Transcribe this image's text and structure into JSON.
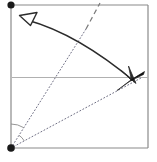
{
  "canvas": {
    "width": 157,
    "height": 162,
    "background": "#ffffff",
    "title": "Square fold diagram with rotation arrow"
  },
  "palette": {
    "frame_stroke": "#8a8a8a",
    "guide_stroke": "#b0b0b0",
    "dotted_stroke": "#6f6f84",
    "dashed_stroke": "#7a7a7a",
    "arrow_stroke": "#2b2b2b",
    "blade_fill": "#111111",
    "vertex_fill": "#1a1a1a"
  },
  "figure": {
    "square": {
      "label": "paper-square-frame",
      "left": 11,
      "top": 5,
      "right": 148,
      "bottom": 148,
      "stroke_width": 1.2
    },
    "vertices": [
      {
        "name": "top-left-vertex",
        "label": "A",
        "x": 11,
        "y": 5,
        "radius": 3.6
      },
      {
        "name": "bottom-left-vertex",
        "label": "B",
        "x": 11,
        "y": 148,
        "radius": 3.8
      }
    ],
    "horizontal_guide": {
      "label": "horizontal-center-guide",
      "x1": 12,
      "y1": 77.5,
      "x2": 148,
      "y2": 77.5,
      "stroke_width": 1.1
    },
    "dotted_rays": [
      {
        "name": "dotted-ray-upper",
        "description": "steep dotted crease from bottom-left vertex toward upper area",
        "x1": 11,
        "y1": 148,
        "x2": 86,
        "y2": 29,
        "dash": "1,2.4"
      },
      {
        "name": "dotted-ray-lower",
        "description": "shallow dotted crease from bottom-left vertex toward blade at right",
        "x1": 11,
        "y1": 148,
        "x2": 141,
        "y2": 78,
        "dash": "1,2.4"
      }
    ],
    "dashed_extension": {
      "name": "dashed-crease-extension",
      "description": "dashed continuation of the steep crease up to the top edge",
      "x1": 86,
      "y1": 29,
      "x2": 100,
      "y2": 3,
      "dash": "5,3.5"
    },
    "angle_arcs": [
      {
        "name": "angle-arc-outer",
        "center_x": 11,
        "center_y": 148,
        "radius": 24,
        "start_deg": -90,
        "end_deg": -57.8
      },
      {
        "name": "angle-arc-inner",
        "center_x": 11,
        "center_y": 148,
        "radius": 15,
        "start_deg": -57.8,
        "end_deg": -28.3
      }
    ],
    "rotation_arrow": {
      "name": "rotation-double-arrow",
      "description": "curved double-headed arrow sweeping from upper-left down to lower-right",
      "start_x": 27,
      "start_y": 20,
      "control_x": 78,
      "control_y": 34,
      "end_x": 135,
      "end_y": 82,
      "stroke_width": 1.5,
      "head_start": {
        "type": "open-triangle",
        "name": "arrowhead-open-upper-left"
      },
      "head_end": {
        "type": "filled-vee",
        "name": "arrowhead-solid-lower-right"
      }
    },
    "blade": {
      "name": "folded-flap-blade",
      "description": "thick tapered black sliver marking the folded flap near the right edge",
      "tip_x": 144,
      "tip_y": 72,
      "tail_x": 117,
      "tail_y": 90
    }
  }
}
